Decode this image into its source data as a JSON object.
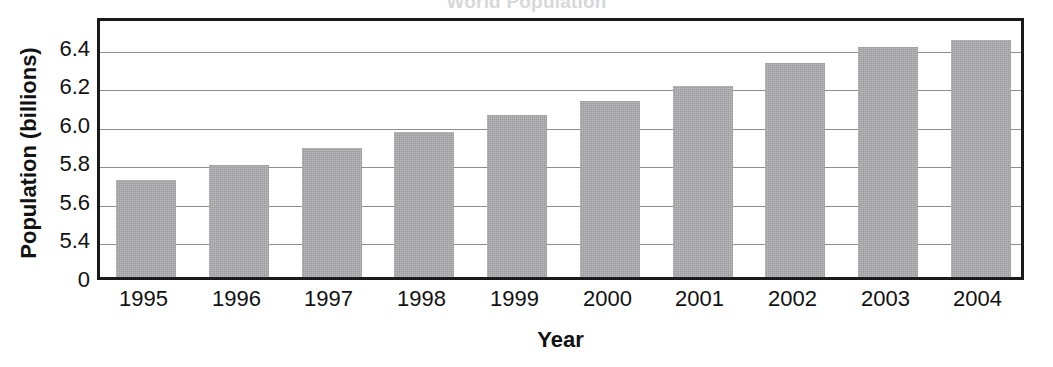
{
  "chart_data": {
    "type": "bar",
    "title": "World Population",
    "xlabel": "Year",
    "ylabel": "Population (billions)",
    "categories": [
      "1995",
      "1996",
      "1997",
      "1998",
      "1999",
      "2000",
      "2001",
      "2002",
      "2003",
      "2004"
    ],
    "values": [
      5.7,
      5.78,
      5.87,
      5.95,
      6.04,
      6.11,
      6.19,
      6.31,
      6.39,
      6.43
    ],
    "ytick_labels": [
      "6.4",
      "6.2",
      "6.0",
      "5.8",
      "5.6",
      "5.4",
      "0"
    ],
    "ytick_values": [
      6.4,
      6.2,
      6.0,
      5.8,
      5.6,
      5.4,
      0
    ],
    "ylim": [
      5.3,
      6.5
    ],
    "axis_break": true,
    "grid": true,
    "legend": "none",
    "series_color": "#9b9b9d",
    "axis_color": "#1a1a1a",
    "gridline_color": "#8d8d8d"
  }
}
